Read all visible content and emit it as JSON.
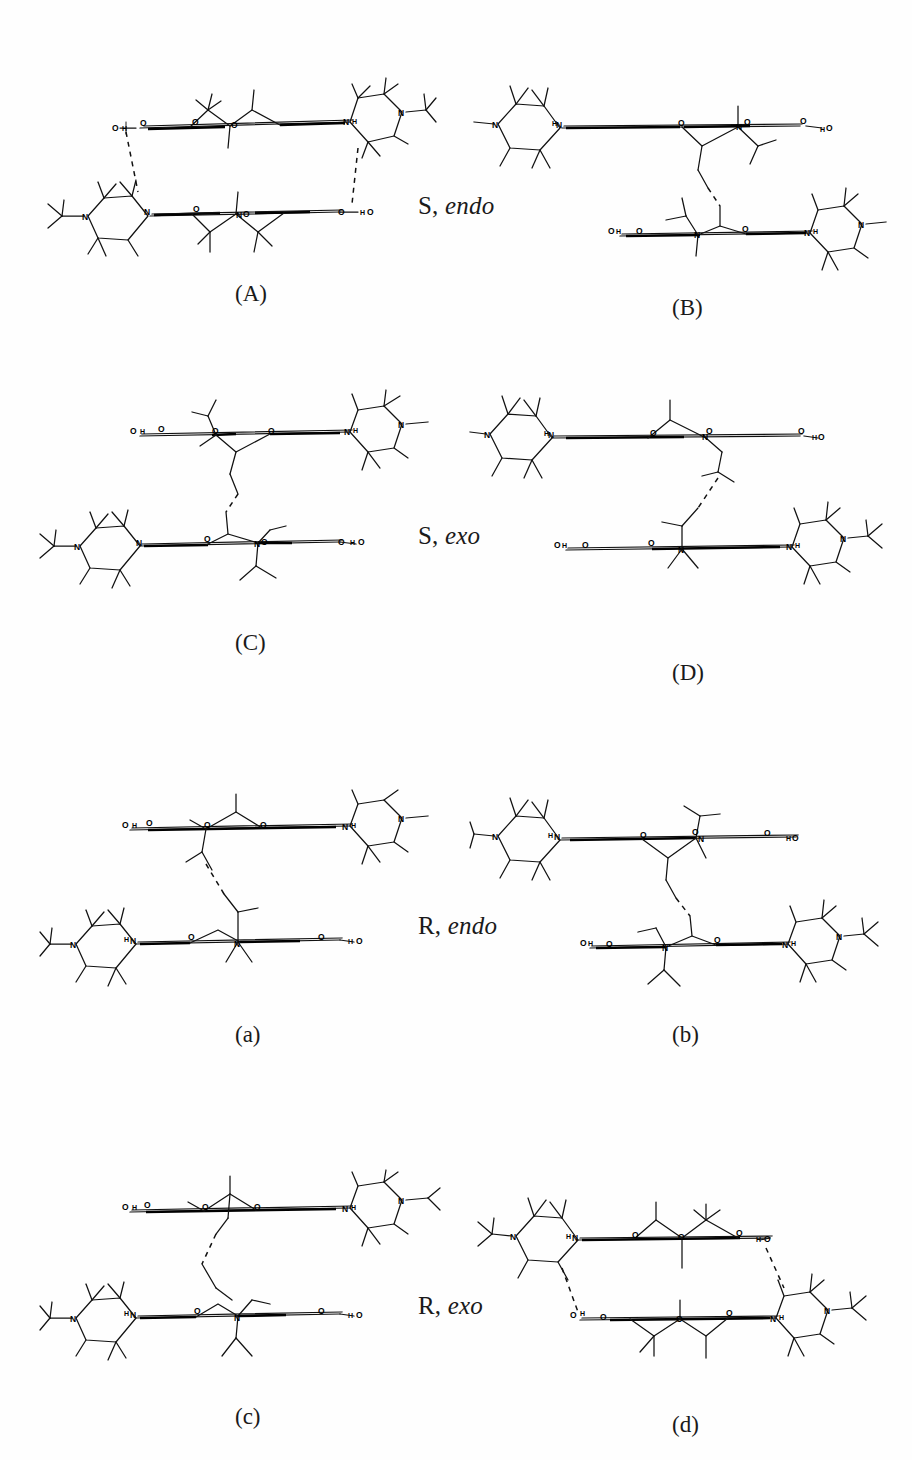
{
  "figure": {
    "background_color": "#ffffff",
    "ink_color": "#111111",
    "width": 912,
    "height": 1460,
    "layout": "2 columns x 4 rows of molecular wireframe structures"
  },
  "row_labels": [
    {
      "id": "row-1",
      "stereo": "S,",
      "conformer": "endo",
      "x": 418,
      "y": 192
    },
    {
      "id": "row-2",
      "stereo": "S,",
      "conformer": "exo",
      "x": 418,
      "y": 522
    },
    {
      "id": "row-3",
      "stereo": "R,",
      "conformer": "endo",
      "x": 418,
      "y": 912
    },
    {
      "id": "row-4",
      "stereo": "R,",
      "conformer": "exo",
      "x": 418,
      "y": 1292
    }
  ],
  "panels": [
    {
      "id": "panel-A",
      "caption": "(A)",
      "caption_x": 235,
      "caption_y": 281,
      "x": 40,
      "y": 70,
      "w": 400,
      "h": 190,
      "variant": "stacked-offset-left",
      "linker": "none",
      "hbonds": 2
    },
    {
      "id": "panel-B",
      "caption": "(B)",
      "caption_x": 672,
      "caption_y": 295,
      "x": 470,
      "y": 70,
      "w": 420,
      "h": 210,
      "variant": "staircase-right",
      "linker": "alkyl-chain",
      "hbonds": 1
    },
    {
      "id": "panel-C",
      "caption": "(C)",
      "caption_x": 235,
      "caption_y": 630,
      "x": 40,
      "y": 390,
      "w": 400,
      "h": 200,
      "variant": "staircase-left",
      "linker": "alkyl-chain",
      "hbonds": 1
    },
    {
      "id": "panel-D",
      "caption": "(D)",
      "caption_x": 672,
      "caption_y": 660,
      "x": 470,
      "y": 390,
      "w": 420,
      "h": 200,
      "variant": "staircase-right-wide",
      "linker": "alkyl-chain",
      "hbonds": 1
    },
    {
      "id": "panel-a",
      "caption": "(a)",
      "caption_x": 235,
      "caption_y": 1022,
      "x": 40,
      "y": 790,
      "w": 400,
      "h": 200,
      "variant": "staircase-left-low",
      "linker": "alkyl-chain",
      "hbonds": 1
    },
    {
      "id": "panel-b",
      "caption": "(b)",
      "caption_x": 672,
      "caption_y": 1022,
      "x": 470,
      "y": 790,
      "w": 420,
      "h": 200,
      "variant": "staircase-right-low",
      "linker": "alkyl-chain",
      "hbonds": 1
    },
    {
      "id": "panel-c",
      "caption": "(c)",
      "caption_x": 235,
      "caption_y": 1404,
      "x": 40,
      "y": 1170,
      "w": 400,
      "h": 200,
      "variant": "staircase-left-tight",
      "linker": "alkyl-chain",
      "hbonds": 1
    },
    {
      "id": "panel-d",
      "caption": "(d)",
      "caption_x": 672,
      "caption_y": 1412,
      "x": 470,
      "y": 1170,
      "w": 420,
      "h": 200,
      "variant": "double-hbond-box",
      "linker": "none",
      "hbonds": 2
    }
  ],
  "atom_labels": {
    "nitrogen": "N",
    "oxygen": "O",
    "hydrogen": "H",
    "hydroxyl": "OH",
    "hydroxyl_rev": "HO",
    "amide_nh": "N",
    "nh": "NH"
  },
  "legend": {
    "note": "Wireframe stick models of molecular dimers; dashed lines denote hydrogen bonds"
  }
}
